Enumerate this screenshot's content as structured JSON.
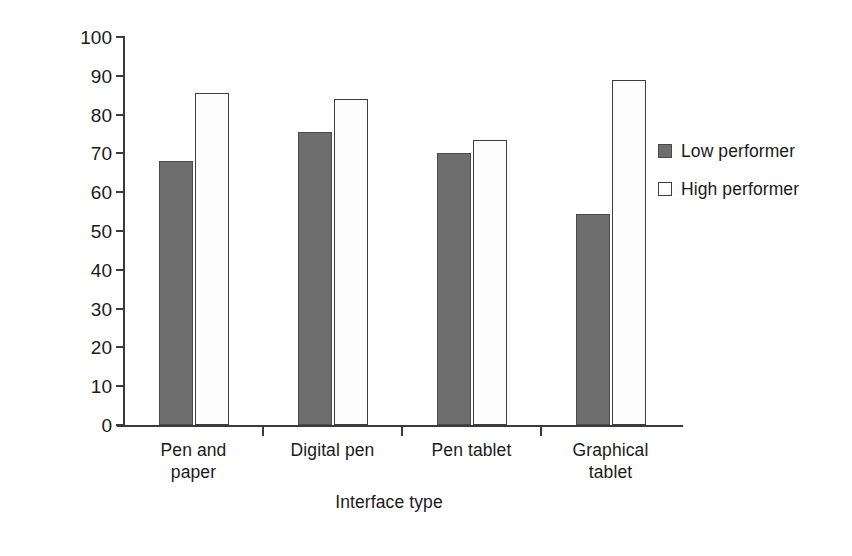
{
  "chart_data": {
    "type": "bar",
    "title": "",
    "xlabel": "Interface type",
    "ylabel": "Percent correct inferences",
    "categories": [
      "Pen and paper",
      "Digital pen",
      "Pen tablet",
      "Graphical tablet"
    ],
    "category_lines": [
      [
        "Pen and",
        "paper"
      ],
      [
        "Digital pen"
      ],
      [
        "Pen tablet"
      ],
      [
        "Graphical",
        "tablet"
      ]
    ],
    "series": [
      {
        "name": "Low performer",
        "values": [
          68,
          75.5,
          70,
          54.5
        ],
        "color": "#6e6e6e"
      },
      {
        "name": "High performer",
        "values": [
          85.5,
          84,
          73.5,
          89
        ],
        "color": "#ffffff"
      }
    ],
    "ylim": [
      0,
      100
    ],
    "yticks": [
      0,
      10,
      20,
      30,
      40,
      50,
      60,
      70,
      80,
      90,
      100
    ],
    "ytick_labels": [
      "0",
      "10",
      "20",
      "30",
      "40",
      "50",
      "60",
      "70",
      "80",
      "90",
      "100"
    ],
    "grid": false,
    "legend_position": "right"
  },
  "legend": {
    "entries": [
      {
        "label": "Low performer",
        "swatch": "filled-gray-square"
      },
      {
        "label": "High performer",
        "swatch": "open-white-square"
      }
    ]
  }
}
